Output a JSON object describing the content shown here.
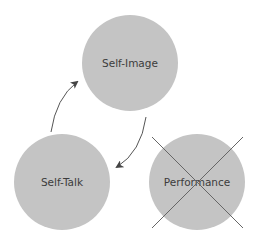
{
  "diagram": {
    "nodes": [
      {
        "id": "self-image",
        "label": "Self-Image",
        "cx": 130,
        "cy": 63,
        "r": 48
      },
      {
        "id": "self-talk",
        "label": "Self-Talk",
        "cx": 62,
        "cy": 182,
        "r": 48
      },
      {
        "id": "performance",
        "label": "Performance",
        "cx": 197,
        "cy": 182,
        "r": 48,
        "crossed_out": true
      }
    ],
    "edges": [
      {
        "from": "self-talk",
        "to": "self-image"
      },
      {
        "from": "self-image",
        "to": "self-talk"
      }
    ],
    "colors": {
      "circle_fill": "#c4c4c4",
      "text": "#3c3c3c",
      "arrow": "#555555",
      "cross": "#666666"
    }
  }
}
